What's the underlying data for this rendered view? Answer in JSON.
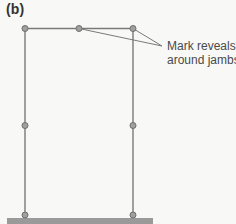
{
  "panel_label": "(b)",
  "callout": {
    "line1": "Mark reveals",
    "line2": "around jambs"
  },
  "colors": {
    "background": "#f8f8f6",
    "frame_line": "#7a7a7a",
    "node_fill": "#a0a0a0",
    "node_stroke": "#6e6e6e",
    "floor": "#9a9a9a",
    "label_text": "#333333",
    "callout_text": "#4a4a4a"
  },
  "frame": {
    "left_jamb_x": 25,
    "right_jamb_x": 133,
    "head_y": 28,
    "sill_y": 216,
    "nodes": [
      {
        "name": "head-left",
        "x": 25,
        "y": 28
      },
      {
        "name": "head-mid",
        "x": 79,
        "y": 28
      },
      {
        "name": "head-right",
        "x": 133,
        "y": 28
      },
      {
        "name": "left-jamb-mid",
        "x": 25,
        "y": 125
      },
      {
        "name": "right-jamb-mid",
        "x": 133,
        "y": 125
      },
      {
        "name": "left-jamb-bottom",
        "x": 25,
        "y": 215
      },
      {
        "name": "right-jamb-bottom",
        "x": 133,
        "y": 215
      }
    ]
  },
  "floor": {
    "x": 7,
    "y": 218,
    "width": 146,
    "height": 6
  }
}
